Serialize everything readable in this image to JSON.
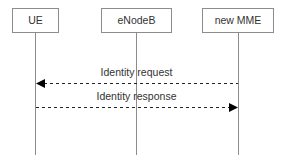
{
  "diagram": {
    "type": "sequence",
    "participants": [
      {
        "id": "ue",
        "label": "UE",
        "x": 35,
        "box_x": 12,
        "box_w": 46
      },
      {
        "id": "enodeb",
        "label": "eNodeB",
        "x": 136,
        "box_x": 101,
        "box_w": 70
      },
      {
        "id": "new_mme",
        "label": "new MME",
        "x": 238,
        "box_x": 202,
        "box_w": 71
      }
    ],
    "messages": [
      {
        "from": "new_mme",
        "to": "ue",
        "label": "Identity request",
        "style": "dashed",
        "y": 83
      },
      {
        "from": "ue",
        "to": "new_mme",
        "label": "Identity response",
        "style": "dashed",
        "y": 107
      }
    ],
    "colors": {
      "box_border": "#8c8c8c",
      "lifeline": "#8c8c8c",
      "arrow": "#000000",
      "text": "#333333"
    }
  }
}
